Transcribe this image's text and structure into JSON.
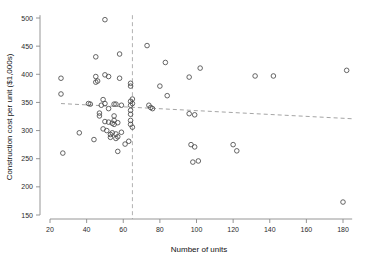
{
  "chart_data": {
    "type": "scatter",
    "title": "",
    "xlabel": "Number of units",
    "ylabel": "Construction cost per unit ($1,000s)",
    "xlim": [
      20,
      185
    ],
    "ylim": [
      150,
      505
    ],
    "xticks": [
      20,
      40,
      60,
      80,
      100,
      120,
      140,
      160,
      180
    ],
    "yticks": [
      150,
      200,
      250,
      300,
      350,
      400,
      450,
      500
    ],
    "grid": false,
    "legend": "none",
    "marker": "open-circle",
    "annotations": {
      "vertical_reference_line": {
        "x": 65,
        "style": "dashed",
        "label": ""
      },
      "trend_line": {
        "style": "dashed",
        "x_start": 26,
        "y_start": 348,
        "x_end": 185,
        "y_end": 321
      }
    },
    "points": [
      {
        "x": 26,
        "y": 393
      },
      {
        "x": 26,
        "y": 365
      },
      {
        "x": 27,
        "y": 260
      },
      {
        "x": 36,
        "y": 296
      },
      {
        "x": 41,
        "y": 348
      },
      {
        "x": 42,
        "y": 347
      },
      {
        "x": 44,
        "y": 284
      },
      {
        "x": 45,
        "y": 431
      },
      {
        "x": 45,
        "y": 396
      },
      {
        "x": 45,
        "y": 386
      },
      {
        "x": 46,
        "y": 388
      },
      {
        "x": 47,
        "y": 331
      },
      {
        "x": 47,
        "y": 326
      },
      {
        "x": 48,
        "y": 345
      },
      {
        "x": 49,
        "y": 355
      },
      {
        "x": 49,
        "y": 303
      },
      {
        "x": 50,
        "y": 497
      },
      {
        "x": 50,
        "y": 399
      },
      {
        "x": 50,
        "y": 348
      },
      {
        "x": 50,
        "y": 316
      },
      {
        "x": 51,
        "y": 300
      },
      {
        "x": 52,
        "y": 396
      },
      {
        "x": 52,
        "y": 339
      },
      {
        "x": 52,
        "y": 315
      },
      {
        "x": 53,
        "y": 293
      },
      {
        "x": 53,
        "y": 288
      },
      {
        "x": 54,
        "y": 313
      },
      {
        "x": 54,
        "y": 296
      },
      {
        "x": 55,
        "y": 347
      },
      {
        "x": 55,
        "y": 326
      },
      {
        "x": 55,
        "y": 318
      },
      {
        "x": 55,
        "y": 311
      },
      {
        "x": 56,
        "y": 347
      },
      {
        "x": 56,
        "y": 294
      },
      {
        "x": 56,
        "y": 286
      },
      {
        "x": 57,
        "y": 314
      },
      {
        "x": 57,
        "y": 289
      },
      {
        "x": 57,
        "y": 263
      },
      {
        "x": 58,
        "y": 393
      },
      {
        "x": 58,
        "y": 436
      },
      {
        "x": 59,
        "y": 345
      },
      {
        "x": 59,
        "y": 297
      },
      {
        "x": 61,
        "y": 276
      },
      {
        "x": 63,
        "y": 281
      },
      {
        "x": 64,
        "y": 384
      },
      {
        "x": 64,
        "y": 379
      },
      {
        "x": 64,
        "y": 352
      },
      {
        "x": 64,
        "y": 345
      },
      {
        "x": 64,
        "y": 336
      },
      {
        "x": 64,
        "y": 329
      },
      {
        "x": 64,
        "y": 318
      },
      {
        "x": 64,
        "y": 311
      },
      {
        "x": 65,
        "y": 356
      },
      {
        "x": 65,
        "y": 348
      },
      {
        "x": 65,
        "y": 306
      },
      {
        "x": 73,
        "y": 451
      },
      {
        "x": 74,
        "y": 345
      },
      {
        "x": 75,
        "y": 341
      },
      {
        "x": 76,
        "y": 339
      },
      {
        "x": 80,
        "y": 379
      },
      {
        "x": 83,
        "y": 421
      },
      {
        "x": 84,
        "y": 362
      },
      {
        "x": 96,
        "y": 330
      },
      {
        "x": 97,
        "y": 275
      },
      {
        "x": 98,
        "y": 244
      },
      {
        "x": 99,
        "y": 328
      },
      {
        "x": 99,
        "y": 271
      },
      {
        "x": 101,
        "y": 246
      },
      {
        "x": 102,
        "y": 411
      },
      {
        "x": 96,
        "y": 395
      },
      {
        "x": 120,
        "y": 275
      },
      {
        "x": 122,
        "y": 264
      },
      {
        "x": 132,
        "y": 397
      },
      {
        "x": 142,
        "y": 397
      },
      {
        "x": 182,
        "y": 407
      },
      {
        "x": 180,
        "y": 173
      }
    ]
  }
}
